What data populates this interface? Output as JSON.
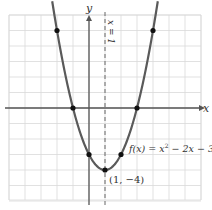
{
  "chart_data": {
    "type": "line",
    "title": "",
    "xlabel": "x",
    "ylabel": "y",
    "xlim": [
      -5,
      7
    ],
    "ylim": [
      -6,
      6
    ],
    "grid": true,
    "series": [
      {
        "name": "f(x) = x^2 - 2x - 3",
        "function": "x^2 - 2x - 3",
        "color": "#555555",
        "x": [
          -2.3,
          -2,
          -1,
          0,
          1,
          2,
          3,
          4,
          4.3
        ],
        "y": [
          6.89,
          5,
          0,
          -3,
          -4,
          -3,
          0,
          5,
          6.89
        ]
      }
    ],
    "points": [
      {
        "x": -2,
        "y": 5
      },
      {
        "x": -1,
        "y": 0
      },
      {
        "x": 0,
        "y": -3
      },
      {
        "x": 1,
        "y": -4
      },
      {
        "x": 2,
        "y": -3
      },
      {
        "x": 3,
        "y": 0
      },
      {
        "x": 4,
        "y": 5
      }
    ],
    "annotations": [
      {
        "text": "x = 1",
        "type": "axis-of-symmetry",
        "style": "dashed"
      },
      {
        "text": "f(x) = x² − 2x − 3",
        "at": [
          2.2,
          -2.5
        ]
      },
      {
        "text": "(1, −4)",
        "at": [
          1,
          -4
        ]
      }
    ]
  },
  "labels": {
    "x_axis": "x",
    "y_axis": "y",
    "symmetry": "x = 1",
    "function_prefix": "f(x) = x",
    "function_exp": "2",
    "function_suffix": " − 2x − 3",
    "vertex": "(1, −4)"
  },
  "colors": {
    "grid": "#d9d9d9",
    "axis": "#555555",
    "curve": "#5a5a5a",
    "point": "#111111"
  }
}
